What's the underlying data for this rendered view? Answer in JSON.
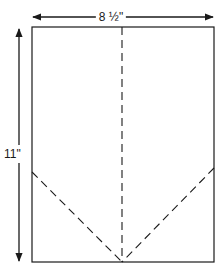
{
  "diagram": {
    "width_label": "8 ½\"",
    "height_label": "11\"",
    "stroke_color": "#1a1a1a",
    "background": "#ffffff",
    "sheet": {
      "x": 32,
      "y": 27,
      "width": 182,
      "height": 235
    },
    "fold_lines": [
      {
        "name": "center-fold",
        "x1": 122,
        "y1": 27,
        "x2": 122,
        "y2": 262
      },
      {
        "name": "left-diagonal-fold",
        "x1": 32,
        "y1": 172,
        "x2": 122,
        "y2": 262
      },
      {
        "name": "right-diagonal-fold",
        "x1": 214,
        "y1": 168,
        "x2": 122,
        "y2": 262
      }
    ]
  }
}
